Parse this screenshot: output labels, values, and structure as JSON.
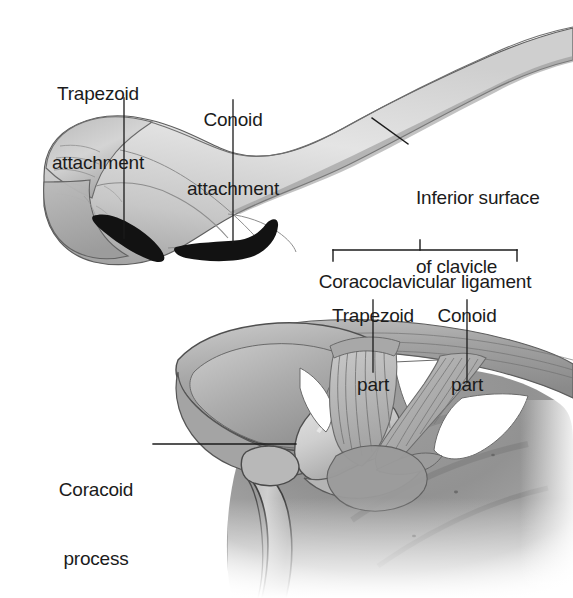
{
  "figure": {
    "background_color": "#ffffff",
    "ink_color": "#1b1b1b",
    "bone_light": "#e2e2e2",
    "bone_mid": "#c3c3c3",
    "bone_dark": "#8d8d8d",
    "attachment_mark_color": "#111111",
    "width": 573,
    "height": 598
  },
  "labels": {
    "trapezoid_attachment": {
      "line1": "Trapezoid",
      "line2": "attachment"
    },
    "conoid_attachment": {
      "line1": "Conoid",
      "line2": "attachment"
    },
    "inferior_surface": {
      "line1": "Inferior surface",
      "line2": "of clavicle"
    },
    "coracoclavicular_ligament": {
      "line1": "Coracoclavicular ligament"
    },
    "trapezoid_part": {
      "line1": "Trapezoid",
      "line2": "part"
    },
    "conoid_part": {
      "line1": "Conoid",
      "line2": "part"
    },
    "coracoid_process": {
      "line1": "Coracoid",
      "line2": "process"
    }
  },
  "panels": {
    "upper": {
      "name": "Inferior view of the lateral end of the clavicle",
      "features": [
        "trapezoid attachment (black oval ridge)",
        "conoid attachment (black hooked tubercle)",
        "inferior surface of clavicle"
      ]
    },
    "lower": {
      "name": "Anterior view of the acromioclavicular region",
      "features": [
        "acromion",
        "coracoid process",
        "trapezoid part of coracoclavicular ligament",
        "conoid part of coracoclavicular ligament",
        "scapular body"
      ]
    }
  }
}
